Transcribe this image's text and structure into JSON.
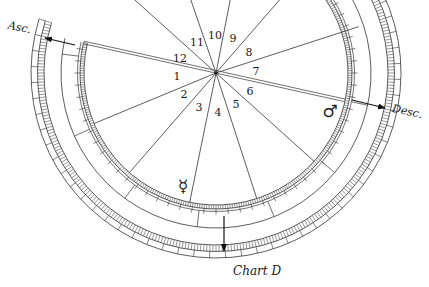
{
  "caption": "Chart D",
  "axes": {
    "asc_label": "Asc.",
    "desc_label": "Desc."
  },
  "houses": [
    {
      "number": "1",
      "x": 177,
      "y": 76
    },
    {
      "number": "2",
      "x": 184,
      "y": 94
    },
    {
      "number": "3",
      "x": 199,
      "y": 107
    },
    {
      "number": "4",
      "x": 218,
      "y": 112
    },
    {
      "number": "5",
      "x": 236,
      "y": 104
    },
    {
      "number": "6",
      "x": 250,
      "y": 91
    },
    {
      "number": "7",
      "x": 256,
      "y": 71
    },
    {
      "number": "8",
      "x": 249,
      "y": 52
    },
    {
      "number": "9",
      "x": 233,
      "y": 38
    },
    {
      "number": "10",
      "x": 215,
      "y": 35
    },
    {
      "number": "11",
      "x": 197,
      "y": 42
    },
    {
      "number": "12",
      "x": 180,
      "y": 58
    }
  ],
  "planets": [
    {
      "name": "Mars",
      "symbol": "♂",
      "x": 330,
      "y": 111
    },
    {
      "name": "Mercury",
      "symbol": "☿",
      "x": 183,
      "y": 186
    }
  ],
  "geometry": {
    "center": [
      216,
      73
    ],
    "cusp_angles_deg": [
      193,
      222,
      251,
      281,
      311,
      342,
      12,
      42,
      72,
      101.5,
      131,
      157.5
    ],
    "divider_angles_deg": [
      187,
      156,
      126,
      97,
      68,
      40,
      12
    ],
    "arc_start_deg": 193,
    "arc_end_deg": 300,
    "ink_color": "#333333"
  }
}
